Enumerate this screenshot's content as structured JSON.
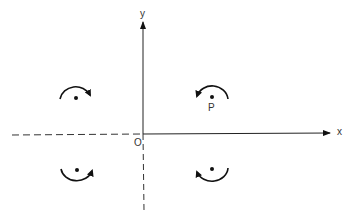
{
  "diagram": {
    "axes": {
      "x_label": "x",
      "y_label": "y",
      "origin_label": "O"
    },
    "point_label": "P",
    "quadrants": [
      {
        "name": "upper-left",
        "rotation": "clockwise",
        "arc": "above"
      },
      {
        "name": "upper-right",
        "rotation": "counterclockwise",
        "arc": "above",
        "label": "P"
      },
      {
        "name": "lower-left",
        "rotation": "counterclockwise",
        "arc": "below"
      },
      {
        "name": "lower-right",
        "rotation": "clockwise",
        "arc": "below"
      }
    ],
    "colors": {
      "ink": "#111111",
      "background": "#ffffff"
    }
  }
}
